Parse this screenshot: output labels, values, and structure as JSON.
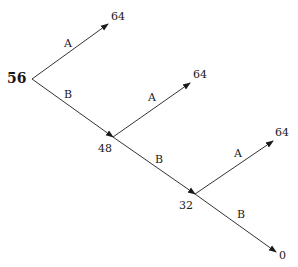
{
  "diagram": {
    "type": "decision-tree",
    "root": {
      "value": "56"
    },
    "nodes": [
      {
        "id": "n1",
        "value": "64",
        "x": 117,
        "y": 16
      },
      {
        "id": "n2",
        "value": "48",
        "x": 105,
        "y": 146
      },
      {
        "id": "n3",
        "value": "64",
        "x": 200,
        "y": 74
      },
      {
        "id": "n4",
        "value": "32",
        "x": 186,
        "y": 203
      },
      {
        "id": "n5",
        "value": "64",
        "x": 280,
        "y": 132
      },
      {
        "id": "n6",
        "value": "0",
        "x": 282,
        "y": 253
      }
    ],
    "edges": [
      {
        "from": "root",
        "to": "n1",
        "label": "A"
      },
      {
        "from": "root",
        "to": "n2",
        "label": "B"
      },
      {
        "from": "n2",
        "to": "n3",
        "label": "A"
      },
      {
        "from": "n2",
        "to": "n4",
        "label": "B"
      },
      {
        "from": "n4",
        "to": "n5",
        "label": "A"
      },
      {
        "from": "n4",
        "to": "n6",
        "label": "B"
      }
    ],
    "edge_labels": [
      "A",
      "B",
      "A",
      "B",
      "A",
      "B"
    ]
  }
}
